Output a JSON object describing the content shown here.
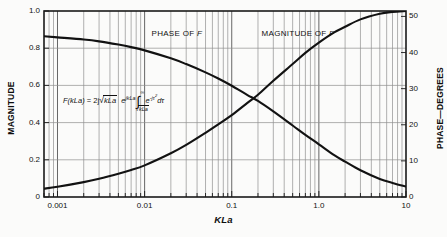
{
  "chart_data": {
    "type": "line",
    "title": "",
    "xlabel": "KLa",
    "ylabel": "MAGNITUDE",
    "y2label": "PHASE—DEGREES",
    "xscale": "log",
    "xlim": [
      0.0007,
      10
    ],
    "ylim": [
      0,
      1.0
    ],
    "y2lim": [
      0,
      51.5
    ],
    "grid": true,
    "legend_position": "inline-annotations",
    "xticks": [
      0.001,
      0.01,
      0.1,
      1.0,
      10
    ],
    "xtick_labels": [
      "0.001",
      "0.01",
      "0.1",
      "1.0",
      "10"
    ],
    "yticks": [
      0,
      0.2,
      0.4,
      0.6,
      0.8,
      1.0
    ],
    "ytick_labels": [
      "0",
      "0.2",
      "0.4",
      "0.6",
      "0.8",
      "1.0"
    ],
    "y2ticks": [
      0,
      10,
      20,
      30,
      40,
      50
    ],
    "y2tick_labels": [
      "0",
      "10",
      "20",
      "30",
      "40",
      "50"
    ],
    "annotations": [
      {
        "text": "PHASE OF F",
        "x": 0.012,
        "y": 0.875
      },
      {
        "text": "MAGNITUDE OF F",
        "x": 0.22,
        "y": 0.875
      }
    ],
    "equation": "F(kLa) = 2j√(kLa) e^(jkLa) ∫_{√(kLa)}^{∞} e^(-jτ²) dτ",
    "series": [
      {
        "name": "MAGNITUDE OF F",
        "axis": "left",
        "x": [
          0.0007,
          0.001,
          0.002,
          0.003,
          0.005,
          0.007,
          0.01,
          0.02,
          0.03,
          0.05,
          0.07,
          0.1,
          0.15,
          0.2,
          0.3,
          0.5,
          0.7,
          1.0,
          1.5,
          2.0,
          3.0,
          5.0,
          7.0,
          10.0
        ],
        "values": [
          0.045,
          0.055,
          0.08,
          0.098,
          0.125,
          0.145,
          0.17,
          0.235,
          0.28,
          0.345,
          0.39,
          0.44,
          0.505,
          0.55,
          0.625,
          0.715,
          0.775,
          0.83,
          0.885,
          0.915,
          0.955,
          0.985,
          0.995,
          1.0
        ]
      },
      {
        "name": "PHASE OF F",
        "axis": "right",
        "x": [
          0.0007,
          0.001,
          0.002,
          0.003,
          0.005,
          0.007,
          0.01,
          0.02,
          0.03,
          0.05,
          0.07,
          0.1,
          0.15,
          0.2,
          0.3,
          0.5,
          0.7,
          1.0,
          1.5,
          2.0,
          3.0,
          5.0,
          7.0,
          10.0
        ],
        "values": [
          44.5,
          44.2,
          43.6,
          43.1,
          42.2,
          41.5,
          40.6,
          38.4,
          36.8,
          34.5,
          32.8,
          30.8,
          28.3,
          26.6,
          23.7,
          19.8,
          17.2,
          14.6,
          11.6,
          9.8,
          7.4,
          5.0,
          3.9,
          2.9
        ]
      }
    ]
  },
  "labels": {
    "y_left": "MAGNITUDE",
    "y_right": "PHASE—DEGREES",
    "x": "KLa",
    "phase_curve": "PHASE OF",
    "phase_curve_var": "F",
    "magnitude_curve": "MAGNITUDE OF",
    "magnitude_curve_var": "F"
  },
  "equation_parts": {
    "lhs_fn": "F",
    "lhs_arg": "(kLa)",
    "equals": "=",
    "coef": "2j",
    "root1": "kLa",
    "exp_base": "e",
    "exp_sup": "jkLa",
    "int_top": "∞",
    "int_bot": "kLa",
    "exp2_base": "e",
    "exp2_sup": "-jτ",
    "exp2_sup_pow": "2",
    "differential": "dτ"
  },
  "colors": {
    "background": "#fbfbfa",
    "curve": "#121212",
    "grid": "#8a8a8a",
    "frame": "#1a1a1a",
    "text": "#111111"
  }
}
